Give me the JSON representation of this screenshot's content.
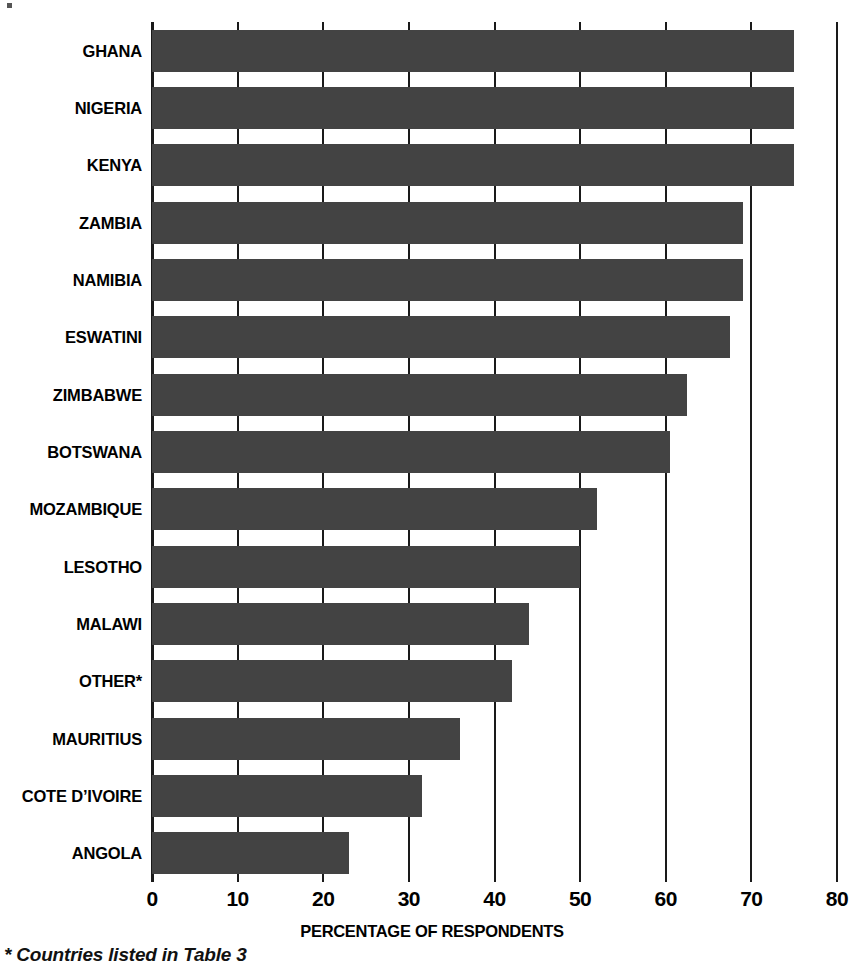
{
  "chart_data": {
    "type": "bar",
    "orientation": "horizontal",
    "title": "",
    "xlabel": "PERCENTAGE OF RESPONDENTS",
    "ylabel": "",
    "xlim": [
      0,
      80
    ],
    "xticks": [
      0,
      10,
      20,
      30,
      40,
      50,
      60,
      70,
      80
    ],
    "xtick_labels": [
      "0",
      "10",
      "20",
      "30",
      "40",
      "50",
      "60",
      "70",
      "80"
    ],
    "grid": true,
    "legend": null,
    "categories": [
      "GHANA",
      "NIGERIA",
      "KENYA",
      "ZAMBIA",
      "NAMIBIA",
      "ESWATINI",
      "ZIMBABWE",
      "BOTSWANA",
      "MOZAMBIQUE",
      "LESOTHO",
      "MALAWI",
      "OTHER*",
      "MAURITIUS",
      "COTE D’IVOIRE",
      "ANGOLA"
    ],
    "values": [
      75,
      75,
      75,
      69,
      69,
      67.5,
      62.5,
      60.5,
      52,
      50,
      44,
      42,
      36,
      31.5,
      23
    ],
    "bar_color": "#434343",
    "axis_color": "#1a1a1a",
    "background": "#ffffff"
  },
  "footnote": "* Countries listed in Table 3",
  "axis": {
    "x_title": "PERCENTAGE OF RESPONDENTS"
  }
}
